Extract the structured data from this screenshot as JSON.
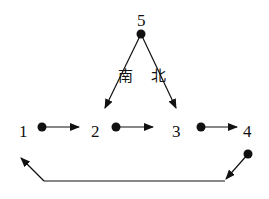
{
  "diagram": {
    "nodes": [
      {
        "id": "1",
        "label": "1"
      },
      {
        "id": "2",
        "label": "2"
      },
      {
        "id": "3",
        "label": "3"
      },
      {
        "id": "4",
        "label": "4"
      },
      {
        "id": "5",
        "label": "5"
      }
    ],
    "edge_labels": {
      "south": "南",
      "north": "北"
    },
    "edges": [
      {
        "from": "5",
        "to": "2",
        "label": "南"
      },
      {
        "from": "5",
        "to": "3",
        "label": "北"
      },
      {
        "from": "1",
        "to": "2"
      },
      {
        "from": "2",
        "to": "3"
      },
      {
        "from": "3",
        "to": "4"
      },
      {
        "from": "4",
        "to": "1"
      }
    ],
    "colors": {
      "stroke": "#111111",
      "background": "#ffffff"
    }
  }
}
